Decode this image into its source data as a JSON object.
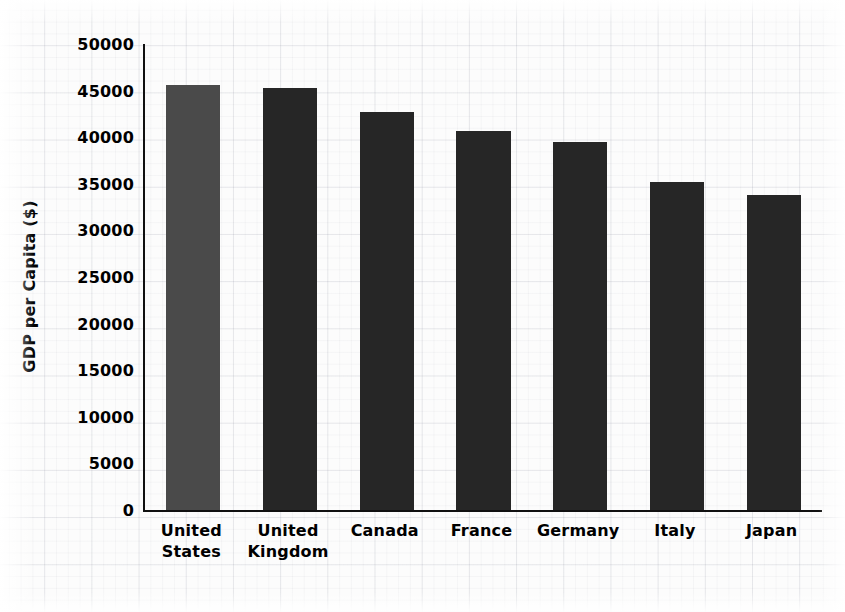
{
  "chart_data": {
    "type": "bar",
    "title": "",
    "xlabel": "",
    "ylabel": "GDP per Capita ($)",
    "categories": [
      "United States",
      "United Kingdom",
      "Canada",
      "France",
      "Germany",
      "Italy",
      "Japan"
    ],
    "category_lines": [
      [
        "United",
        "States"
      ],
      [
        "United",
        "Kingdom"
      ],
      [
        "Canada"
      ],
      [
        "France"
      ],
      [
        "Germany"
      ],
      [
        "Italy"
      ],
      [
        "Japan"
      ]
    ],
    "values": [
      45600,
      45300,
      42700,
      40700,
      39500,
      35200,
      33800
    ],
    "ylim": [
      0,
      50000
    ],
    "ytick_values": [
      0,
      5000,
      10000,
      15000,
      20000,
      25000,
      30000,
      35000,
      40000,
      45000,
      50000
    ],
    "ytick_labels": [
      "0",
      "5000",
      "10000",
      "15000",
      "20000",
      "25000",
      "30000",
      "35000",
      "40000",
      "45000",
      "50000"
    ],
    "grid": false,
    "legend": null,
    "bar_colors": [
      "#4a4a4a",
      "#262626",
      "#262626",
      "#262626",
      "#262626",
      "#262626",
      "#262626"
    ],
    "highlight_color": "#4a4a4a",
    "default_bar_color": "#262626",
    "axis_color": "#111111",
    "background_color": "#fcfcfc"
  }
}
